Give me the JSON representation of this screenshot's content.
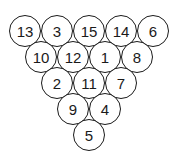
{
  "diagram": {
    "type": "triangle-rack",
    "rows": [
      [
        "13",
        "3",
        "15",
        "14",
        "6"
      ],
      [
        "10",
        "12",
        "1",
        "8"
      ],
      [
        "2",
        "11",
        "7"
      ],
      [
        "9",
        "4"
      ],
      [
        "5"
      ]
    ],
    "colors": {
      "stroke": "#1a1a1a",
      "fill": "#ffffff"
    }
  }
}
